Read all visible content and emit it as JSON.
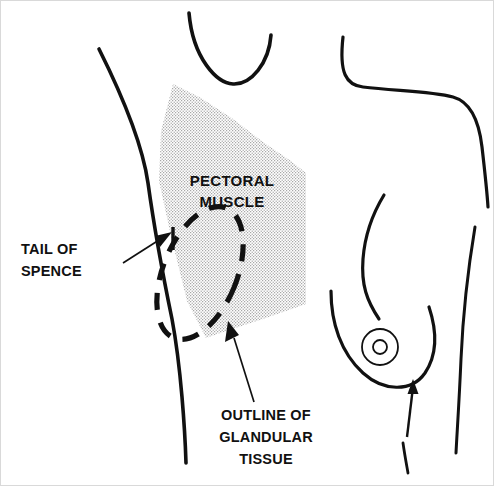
{
  "figure": {
    "kind": "anatomical-line-drawing",
    "background_color": "#ffffff",
    "ink_color": "#111111",
    "shading_color": "#bfbfbf",
    "border_color": "#d9d9d9"
  },
  "labels": {
    "pectoral": {
      "line1": "PECTORAL",
      "line2": "MUSCLE",
      "center_x": 231,
      "line1_y": 185,
      "line2_y": 206,
      "anchor": "middle"
    },
    "tail_of_spence": {
      "line1": "TAIL OF",
      "line2": "SPENCE",
      "x": 20,
      "line1_y": 253,
      "line2_y": 275,
      "anchor": "start"
    },
    "glandular": {
      "line1": "OUTLINE OF",
      "line2": "GLANDULAR",
      "line3": "TISSUE",
      "center_x": 265,
      "line1_y": 419,
      "line2_y": 441,
      "line3_y": 463,
      "anchor": "middle"
    }
  },
  "regions": {
    "pectoral_muscle": {
      "name": "PECTORAL MUSCLE",
      "fill": "shaded-stipple",
      "fill_color": "#bfbfbf",
      "polygon": "172,83 200,97 232,118 262,141 290,160 305,172 305,303 262,318 225,330 205,337 186,300 170,235 158,180 160,130"
    },
    "glandular_tissue": {
      "name": "OUTLINE OF GLANDULAR TISSUE",
      "stroke": "dashed",
      "shape": "tilted-ellipse",
      "center_x": 199,
      "center_y": 272,
      "rx": 37,
      "ry": 70,
      "rotation_deg": 22
    }
  },
  "markers": {
    "tail_of_spence_arrow": {
      "name": "tail-of-spence-pointer",
      "leader_from_x": 122,
      "leader_from_y": 262,
      "leader_to_x": 160,
      "leader_to_y": 238,
      "tick_x": 172,
      "tick_y1": 227,
      "tick_y2": 248
    },
    "glandular_arrow": {
      "name": "glandular-tissue-pointer",
      "leader_from_x": 253,
      "leader_from_y": 401,
      "leader_to_x": 228,
      "leader_to_y": 325
    },
    "inframammary_arrow": {
      "name": "inframammary-fold-pointer",
      "from_x": 406,
      "from_y": 436,
      "to_x": 412,
      "to_y": 382
    },
    "nipple": {
      "name": "nipple-areola",
      "center_x": 379,
      "center_y": 346,
      "outer_radius": 18,
      "inner_radius": 7
    }
  },
  "body_outline": {
    "chin_jaw": "M 188,12 C 192,58 216,82 232,83 C 250,84 268,62 270,34",
    "left_arm_inner": "M 98,48 C 120,92 141,140 147,182 C 152,218 160,265 171,318 C 180,366 184,430 185,462",
    "neck_shoulder_right": "M 342,36 C 338,72 345,84 362,86 C 394,90 430,90 452,96 C 470,101 478,120 481,146 C 484,172 486,190 487,206",
    "breast_upper": "M 383,194 C 372,212 364,232 362,258 C 360,284 366,300 378,318",
    "breast_lower": "M 330,290 C 330,322 340,352 362,372 C 382,390 410,392 424,372 C 436,354 436,330 428,306",
    "flank_right": "M 474,226 C 468,262 462,312 460,358 C 458,404 456,432 455,452",
    "abdomen_fold": "M 402,442 C 404,456 406,466 407,472"
  }
}
